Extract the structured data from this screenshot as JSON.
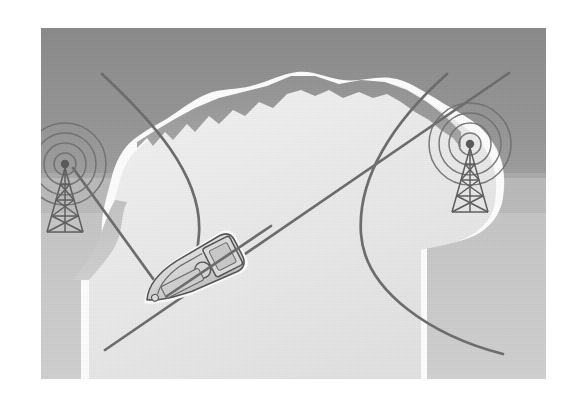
{
  "figure": {
    "canvas": {
      "width": 578,
      "height": 400,
      "background": "#ffffff"
    },
    "scene": {
      "x": 41,
      "y": 28,
      "width": 505,
      "height": 351
    }
  },
  "palette": {
    "page_background": "#ffffff",
    "sky_dark_gray": "#8d8d8d",
    "water_mid_gray": "#bdbdbd",
    "water_light_gray": "#cbcbcb",
    "land_white": "#ececec",
    "coast_highlight": "#fdfdfd",
    "line_gray": "#6c6c6c",
    "tower_gray": "#5e5e5e",
    "wave_ring_gray": "#6f6f6f",
    "boat_outline": "#555555",
    "boat_fill": "#d2d2d2",
    "boat_highlight": "#fbfbfb"
  },
  "elements": {
    "background_region_label": "upper dark gray region",
    "land_region_label": "white land mass / coastline",
    "water_region_label": "lower light gray water region"
  },
  "towers": [
    {
      "id": "left-tower",
      "label": "Left transmitter tower",
      "position": {
        "x": 24,
        "y": 135
      },
      "antenna_point": {
        "x": 24,
        "y": 135
      },
      "wave_rings": 4,
      "ring_radii": [
        12,
        22,
        32,
        42
      ]
    },
    {
      "id": "right-tower",
      "label": "Right transmitter tower",
      "position": {
        "x": 428,
        "y": 115
      },
      "antenna_point": {
        "x": 428,
        "y": 115
      },
      "wave_rings": 4,
      "ring_radii": [
        12,
        22,
        32,
        42
      ]
    }
  ],
  "vessel": {
    "id": "boat",
    "label": "Boat receiver",
    "position": {
      "x": 135,
      "y": 280
    },
    "rotation_degrees": -28,
    "length": 82,
    "beam": 30
  },
  "lines_of_position": [
    {
      "id": "hyperbola-left",
      "label": "Left hyperbolic line of position",
      "type": "curve",
      "stroke": "#6c6c6c",
      "stroke_width": 2.6,
      "path": "M 61,46 C 110,92 160,150 155,208 C 152,246 140,258 128,266"
    },
    {
      "id": "hyperbola-right",
      "label": "Right hyperbolic line of position",
      "type": "curve",
      "stroke": "#6c6c6c",
      "stroke_width": 2.6,
      "path": "M 404,47 C 350,95 318,150 322,205 C 326,262 392,306 462,324"
    },
    {
      "id": "bearing-line",
      "label": "Straight bearing line through both towers and the boat",
      "type": "line",
      "stroke": "#6c6c6c",
      "stroke_width": 2.6,
      "from": {
        "x": 64,
        "y": 322
      },
      "to": {
        "x": 466,
        "y": 45
      }
    }
  ]
}
